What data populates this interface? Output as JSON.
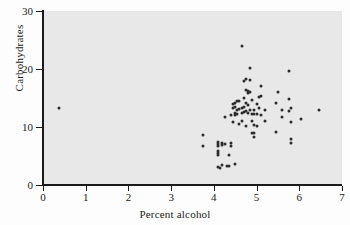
{
  "chart_data": {
    "type": "scatter",
    "title": "",
    "xlabel": "Percent alcohol",
    "ylabel": "Carbohydrates",
    "xlim": [
      0,
      7
    ],
    "ylim": [
      0,
      30
    ],
    "xticks": [
      0,
      1,
      2,
      3,
      4,
      5,
      6,
      7
    ],
    "yticks": [
      0,
      10,
      20,
      30
    ],
    "grid": false,
    "legend": null,
    "marker_color": "#2b2b2b",
    "panel_color": "#e8e8e8",
    "points": [
      [
        0.38,
        13.3
      ],
      [
        3.75,
        8.6
      ],
      [
        3.75,
        6.8
      ],
      [
        4.1,
        7.4
      ],
      [
        4.1,
        7.0
      ],
      [
        4.1,
        6.7
      ],
      [
        4.1,
        5.8
      ],
      [
        4.1,
        5.5
      ],
      [
        4.1,
        5.1
      ],
      [
        4.1,
        3.1
      ],
      [
        4.15,
        3.0
      ],
      [
        4.2,
        3.4
      ],
      [
        4.2,
        7.3
      ],
      [
        4.2,
        6.9
      ],
      [
        4.25,
        11.8
      ],
      [
        4.25,
        7.1
      ],
      [
        4.3,
        3.3
      ],
      [
        4.35,
        3.3
      ],
      [
        4.35,
        5.2
      ],
      [
        4.4,
        12.1
      ],
      [
        4.4,
        7.2
      ],
      [
        4.4,
        6.8
      ],
      [
        4.45,
        13.9
      ],
      [
        4.45,
        13.2
      ],
      [
        4.45,
        10.9
      ],
      [
        4.5,
        14.2
      ],
      [
        4.5,
        13.4
      ],
      [
        4.5,
        12.4
      ],
      [
        4.5,
        12.0
      ],
      [
        4.5,
        3.6
      ],
      [
        4.55,
        14.4
      ],
      [
        4.55,
        13.0
      ],
      [
        4.55,
        12.2
      ],
      [
        4.6,
        14.5
      ],
      [
        4.6,
        13.1
      ],
      [
        4.6,
        10.6
      ],
      [
        4.65,
        24.0
      ],
      [
        4.65,
        13.3
      ],
      [
        4.65,
        12.4
      ],
      [
        4.65,
        11.0
      ],
      [
        4.7,
        17.9
      ],
      [
        4.7,
        15.0
      ],
      [
        4.7,
        13.4
      ],
      [
        4.7,
        12.6
      ],
      [
        4.75,
        18.2
      ],
      [
        4.75,
        16.4
      ],
      [
        4.75,
        14.2
      ],
      [
        4.75,
        12.8
      ],
      [
        4.75,
        10.2
      ],
      [
        4.8,
        16.2
      ],
      [
        4.8,
        15.9
      ],
      [
        4.8,
        13.8
      ],
      [
        4.8,
        12.4
      ],
      [
        4.85,
        20.2
      ],
      [
        4.85,
        18.1
      ],
      [
        4.85,
        16.0
      ],
      [
        4.85,
        12.9
      ],
      [
        4.9,
        14.6
      ],
      [
        4.9,
        12.3
      ],
      [
        4.9,
        11.0
      ],
      [
        4.9,
        9.0
      ],
      [
        4.95,
        13.0
      ],
      [
        4.95,
        12.2
      ],
      [
        4.95,
        10.3
      ],
      [
        4.95,
        8.9
      ],
      [
        4.95,
        8.3
      ],
      [
        5.0,
        14.0
      ],
      [
        5.0,
        12.3
      ],
      [
        5.0,
        10.1
      ],
      [
        5.05,
        15.2
      ],
      [
        5.05,
        13.2
      ],
      [
        5.1,
        17.1
      ],
      [
        5.1,
        15.3
      ],
      [
        5.1,
        12.0
      ],
      [
        5.2,
        13.0
      ],
      [
        5.2,
        11.1
      ],
      [
        5.45,
        14.1
      ],
      [
        5.45,
        9.2
      ],
      [
        5.5,
        16.0
      ],
      [
        5.6,
        13.0
      ],
      [
        5.6,
        11.8
      ],
      [
        5.75,
        19.7
      ],
      [
        5.75,
        14.9
      ],
      [
        5.75,
        12.8
      ],
      [
        5.8,
        13.2
      ],
      [
        5.8,
        10.9
      ],
      [
        5.8,
        8.0
      ],
      [
        5.8,
        7.2
      ],
      [
        6.05,
        11.4
      ],
      [
        6.45,
        13.0
      ]
    ],
    "n_points": 90
  }
}
